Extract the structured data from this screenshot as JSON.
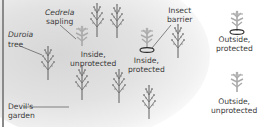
{
  "diagram": {
    "type": "illustration",
    "colors": {
      "duroia_tree": "#6e6e6e",
      "cedrela_sapling": "#a8a8a8",
      "barrier_ring": "#2a2a2a",
      "garden_background": "#dcdcdc",
      "text": "#3a3a3a"
    },
    "labels": {
      "cedrela_line1": "Cedrela",
      "cedrela_line2": "sapling",
      "duroia_line1": "Duroia",
      "duroia_line2": "tree",
      "barrier_line1": "Insect",
      "barrier_line2": "barrier",
      "inside_unprotected_line1": "Inside,",
      "inside_unprotected_line2": "unprotected",
      "inside_protected_line1": "Inside,",
      "inside_protected_line2": "protected",
      "outside_protected_line1": "Outside,",
      "outside_protected_line2": "protected",
      "outside_unprotected_line1": "Outside,",
      "outside_unprotected_line2": "unprotected",
      "devils_garden_line1": "Devil's",
      "devils_garden_line2": "garden"
    },
    "conditions": [
      {
        "name": "Inside, unprotected",
        "location": "inside",
        "barrier": false
      },
      {
        "name": "Inside, protected",
        "location": "inside",
        "barrier": true
      },
      {
        "name": "Outside, protected",
        "location": "outside",
        "barrier": true
      },
      {
        "name": "Outside, unprotected",
        "location": "outside",
        "barrier": false
      }
    ]
  }
}
